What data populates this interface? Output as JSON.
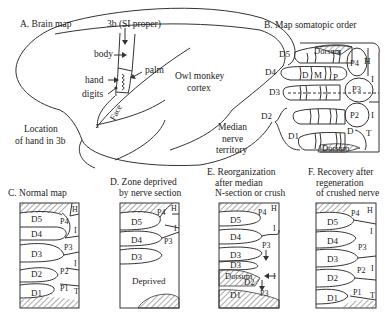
{
  "panel_a": {
    "title": "A. Brain map",
    "area_label": "3b (SI proper)",
    "body": "body",
    "palm": "palm",
    "hand": "hand",
    "digits": "digits",
    "face": "Face",
    "cortex_line1": "Owl monkey",
    "cortex_line2": "cortex",
    "location_line1": "Location",
    "location_line2": "of hand in 3b"
  },
  "panel_b": {
    "title": "B. Map somatopic order",
    "digits": [
      "D5",
      "D4",
      "D3",
      "D2",
      "D1"
    ],
    "segments": [
      "D",
      "M",
      "P"
    ],
    "pads": [
      "P4",
      "P3",
      "P2"
    ],
    "dorsum_top": "Dorsum",
    "dorsum_bottom": "Dorsum",
    "h": "H",
    "i1": "I",
    "i2": "I",
    "t": "T",
    "d1_pad": "D",
    "median_line1": "Median",
    "median_line2": "nerve",
    "median_line3": "territory"
  },
  "panel_c": {
    "title": "C. Normal map",
    "digits": [
      "D5",
      "D4",
      "D3",
      "D2",
      "D1"
    ],
    "pads": [
      "P4",
      "P3",
      "P2",
      "P1"
    ],
    "h": "H",
    "i1": "I",
    "i2": "I",
    "t": "T"
  },
  "panel_d": {
    "title_line1": "D. Zone deprived",
    "title_line2": "by nerve section",
    "digits": [
      "D5",
      "D4",
      "D3"
    ],
    "pads": [
      "P4",
      "P3"
    ],
    "h": "H",
    "i1": "I",
    "deprived": "Deprived"
  },
  "panel_e": {
    "title_line1": "E. Reorganization",
    "title_line2": "after median",
    "title_line3": "N-section or crush",
    "digits": [
      "D5",
      "D4",
      "D3",
      "D3",
      "D2",
      "D1"
    ],
    "pads": [
      "P4",
      "P3",
      "P3"
    ],
    "dorsum": "Dorsum",
    "h": "H",
    "i1": "I",
    "i2": "I"
  },
  "panel_f": {
    "title_line1": "F. Recovery after",
    "title_line2": "regeneration",
    "title_line3": "of crushed nerve",
    "digits": [
      "D5",
      "D4",
      "D3",
      "D2",
      "D1"
    ],
    "pads": [
      "P4",
      "P3",
      "P2",
      "P1"
    ],
    "h": "H",
    "i1": "I",
    "i2": "I",
    "t": "T"
  }
}
